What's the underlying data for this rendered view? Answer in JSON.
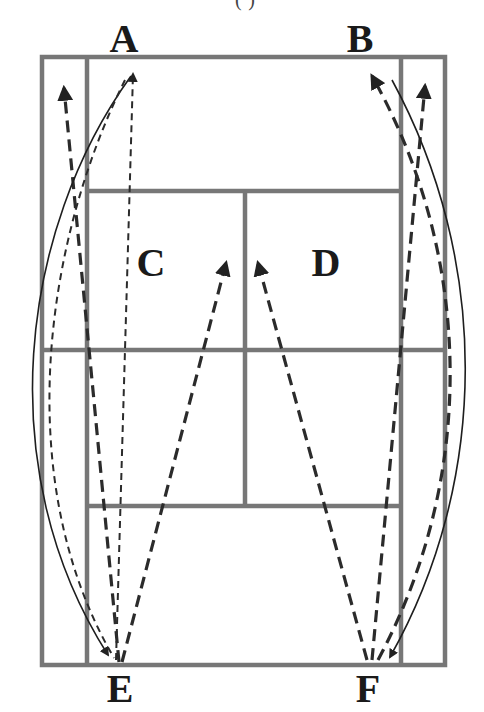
{
  "caption_fragment": "(·)",
  "labels": {
    "A": "A",
    "B": "B",
    "C": "C",
    "D": "D",
    "E": "E",
    "F": "F"
  },
  "colors": {
    "court_lines": "#777777",
    "arrows": "#2b2b2b",
    "labels": "#1a1a1a",
    "background": "#ffffff"
  },
  "court": {
    "outer": {
      "x1": 42,
      "y1": 57,
      "x2": 445,
      "y2": 665
    },
    "inner_sidelines": {
      "left_x": 87,
      "right_x": 401
    },
    "service_lines": {
      "top_y": 191,
      "bottom_y": 506
    },
    "net_y": 350,
    "center_line_x": 245
  },
  "shot_paths": [
    {
      "from": "E",
      "to": "A-alley",
      "style": "dashed",
      "note": "E to top-left alley"
    },
    {
      "from": "E",
      "to": "A",
      "style": "dashed",
      "note": "E to A"
    },
    {
      "from": "E",
      "to": "C",
      "style": "dashed",
      "note": "E to C service box"
    },
    {
      "from": "F",
      "to": "D",
      "style": "dashed",
      "note": "F to D service box"
    },
    {
      "from": "F",
      "to": "B",
      "style": "dashed",
      "note": "F to B"
    },
    {
      "from": "F",
      "to": "B-alley",
      "style": "dashed",
      "note": "F to top-right alley"
    },
    {
      "from": "A",
      "to": "E",
      "style": "solid-curve",
      "note": "return curve A to E"
    },
    {
      "from": "A",
      "to": "E",
      "style": "thin-dashed-curve",
      "note": "return curve A to E"
    },
    {
      "from": "B",
      "to": "F",
      "style": "solid-curve",
      "note": "return curve B to F"
    },
    {
      "from": "B",
      "to": "F",
      "style": "thin-dashed-curve",
      "note": "return curve B to F"
    }
  ]
}
